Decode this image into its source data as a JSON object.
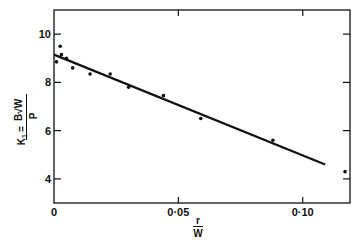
{
  "chart_data": {
    "type": "scatter",
    "title": "",
    "xlabel": "r / W",
    "xlabel_numerator": "r",
    "xlabel_denominator": "W",
    "ylabel": "K1 = B√W / P",
    "ylabel_lhs": "K",
    "ylabel_subscript": "1",
    "ylabel_eq": "=",
    "ylabel_numerator": "B√W",
    "ylabel_denominator": "P",
    "xlim": [
      0,
      0.119
    ],
    "ylim": [
      3.0,
      11.0
    ],
    "x_ticks": [
      0,
      0.05,
      0.1
    ],
    "x_tick_labels": [
      "0",
      "0·05",
      "0·10"
    ],
    "y_ticks": [
      4,
      6,
      8,
      10
    ],
    "y_tick_labels": [
      "4",
      "6",
      "8",
      "10"
    ],
    "grid": false,
    "legend": null,
    "series": [
      {
        "name": "measured points",
        "type": "scatter",
        "points": [
          {
            "x": 0.001,
            "y": 8.85
          },
          {
            "x": 0.0025,
            "y": 9.5
          },
          {
            "x": 0.003,
            "y": 9.15
          },
          {
            "x": 0.005,
            "y": 9.0
          },
          {
            "x": 0.0075,
            "y": 8.6
          },
          {
            "x": 0.0145,
            "y": 8.35
          },
          {
            "x": 0.0226,
            "y": 8.35
          },
          {
            "x": 0.03,
            "y": 7.8
          },
          {
            "x": 0.044,
            "y": 7.45
          },
          {
            "x": 0.059,
            "y": 6.5
          },
          {
            "x": 0.088,
            "y": 5.6
          },
          {
            "x": 0.117,
            "y": 4.3
          }
        ]
      },
      {
        "name": "fitted line",
        "type": "line",
        "points": [
          {
            "x": 0.0,
            "y": 9.15
          },
          {
            "x": 0.109,
            "y": 4.6
          }
        ]
      }
    ]
  },
  "colors": {
    "ink": "#111111",
    "background": "#ffffff"
  }
}
